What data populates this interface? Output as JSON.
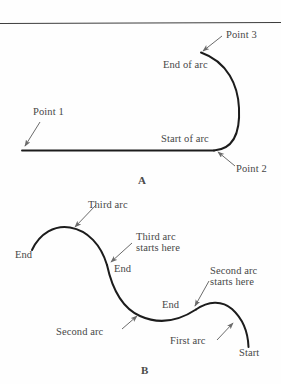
{
  "figure": {
    "title_a": "A",
    "title_b": "B",
    "stroke_color": "#1c1c1c",
    "rule_color": "#3d3d3d",
    "arrow_color": "#6b6b6b",
    "text_color": "#474747",
    "background_color": "#fefefe"
  },
  "panel_a": {
    "letter": "A",
    "labels": [
      {
        "id": "point3",
        "text": "Point 3"
      },
      {
        "id": "end-of-arc",
        "text": "End of arc"
      },
      {
        "id": "point1",
        "text": "Point 1"
      },
      {
        "id": "start-of-arc",
        "text": "Start of arc"
      },
      {
        "id": "point2",
        "text": "Point 2"
      }
    ]
  },
  "panel_b": {
    "letter": "B",
    "labels": [
      {
        "id": "third-arc",
        "text": "Third arc"
      },
      {
        "id": "third-arc-starts-here-1",
        "text": "Third arc"
      },
      {
        "id": "third-arc-starts-here-2",
        "text": "starts here"
      },
      {
        "id": "end-left",
        "text": "End"
      },
      {
        "id": "end-middle",
        "text": "End"
      },
      {
        "id": "end-right",
        "text": "End"
      },
      {
        "id": "second-arc-starts-here-1",
        "text": "Second arc"
      },
      {
        "id": "second-arc-starts-here-2",
        "text": "starts here"
      },
      {
        "id": "second-arc",
        "text": "Second arc"
      },
      {
        "id": "first-arc",
        "text": "First arc"
      },
      {
        "id": "start",
        "text": "Start"
      }
    ]
  }
}
